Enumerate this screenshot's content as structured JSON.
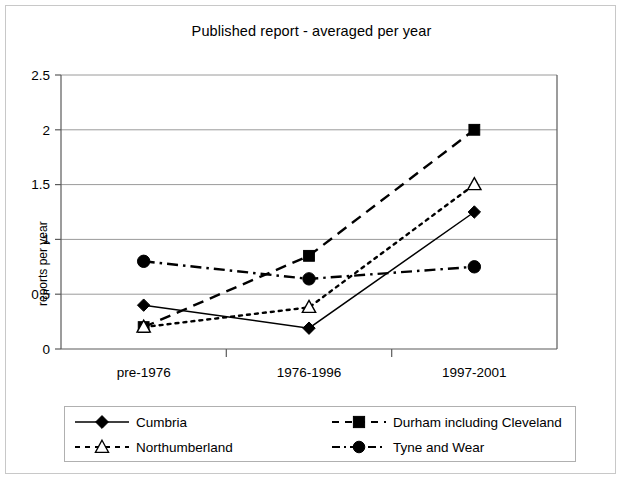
{
  "chart_data": {
    "type": "line",
    "title": "Published report - averaged per year",
    "xlabel": "",
    "ylabel": "reports per year",
    "categories": [
      "pre-1976",
      "1976-1996",
      "1997-2001"
    ],
    "ylim": [
      0,
      2.5
    ],
    "yticks": [
      "0",
      "0.5",
      "1",
      "1.5",
      "2",
      "2.5"
    ],
    "ytick_values": [
      0,
      0.5,
      1,
      1.5,
      2,
      2.5
    ],
    "grid": "horizontal",
    "legend_position": "bottom",
    "series": [
      {
        "name": "Cumbria",
        "values": [
          0.4,
          0.19,
          1.25
        ],
        "marker": "filled-diamond",
        "line_style": "solid",
        "color": "#000000"
      },
      {
        "name": "Durham including Cleveland",
        "values": [
          0.2,
          0.85,
          2.0
        ],
        "marker": "filled-square",
        "line_style": "dashed",
        "color": "#000000"
      },
      {
        "name": "Northumberland",
        "values": [
          0.2,
          0.38,
          1.5
        ],
        "marker": "open-triangle",
        "line_style": "dotted",
        "color": "#000000"
      },
      {
        "name": "Tyne and Wear",
        "values": [
          0.8,
          0.64,
          0.75
        ],
        "marker": "filled-circle",
        "line_style": "dash-dot",
        "color": "#000000"
      }
    ]
  },
  "legend": {
    "items": [
      {
        "label": "Cumbria"
      },
      {
        "label": "Durham including Cleveland"
      },
      {
        "label": "Northumberland"
      },
      {
        "label": "Tyne and Wear"
      }
    ]
  },
  "colors": {
    "series": "#000000",
    "grid": "#999999",
    "axis": "#555555",
    "frame": "#c8c8c8",
    "background": "#ffffff"
  }
}
